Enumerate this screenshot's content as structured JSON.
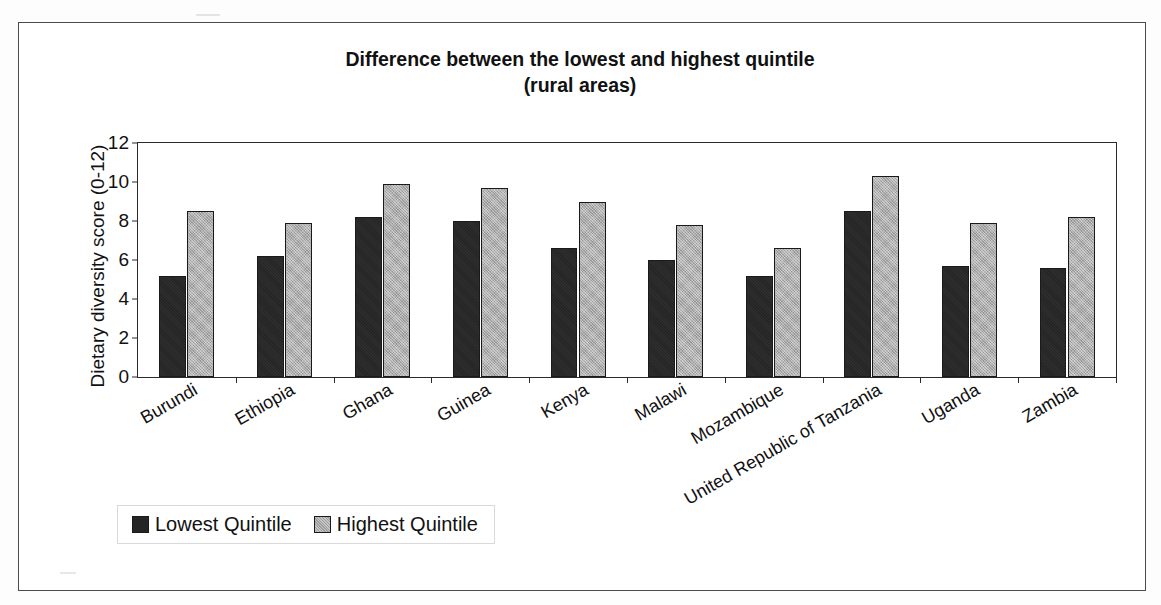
{
  "chart_data": {
    "type": "bar",
    "title": "Difference between the lowest and highest quintile (rural areas)",
    "title_line1": "Difference between the lowest and highest quintile",
    "title_line2": "(rural areas)",
    "xlabel": "",
    "ylabel": "Dietary diversity score (0-12)",
    "ylim": [
      0,
      12
    ],
    "ytick_labels": [
      "0",
      "2",
      "4",
      "6",
      "8",
      "10",
      "12"
    ],
    "yticks": [
      0,
      2,
      4,
      6,
      8,
      10,
      12
    ],
    "grid": false,
    "legend_position": "bottom-left",
    "categories": [
      "Burundi",
      "Ethiopia",
      "Ghana",
      "Guinea",
      "Kenya",
      "Malawi",
      "Mozambique",
      "United Republic of Tanzania",
      "Uganda",
      "Zambia"
    ],
    "series": [
      {
        "name": "Lowest Quintile",
        "color": "#252525",
        "values": [
          5.2,
          6.2,
          8.2,
          8.0,
          6.6,
          6.0,
          5.2,
          8.5,
          5.7,
          5.6
        ]
      },
      {
        "name": "Highest Quintile",
        "color": "#a9a9a9",
        "values": [
          8.5,
          7.9,
          9.9,
          9.7,
          9.0,
          7.8,
          6.6,
          10.3,
          7.9,
          8.2
        ]
      }
    ]
  },
  "legend": {
    "entries": [
      {
        "label": "Lowest Quintile",
        "swatch": "black-square-icon"
      },
      {
        "label": "Highest Quintile",
        "swatch": "gray-square-icon"
      }
    ]
  }
}
